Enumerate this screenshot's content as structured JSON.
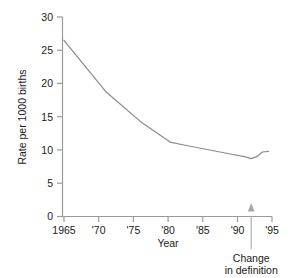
{
  "chart_data": {
    "type": "line",
    "title": "",
    "xlabel": "Year",
    "ylabel": "Rate per 1000 births",
    "xlim": [
      1963.5,
      1995.5
    ],
    "ylim": [
      0,
      30
    ],
    "grid": false,
    "legend": null,
    "line_color": "#8c8c8c",
    "axis_color": "#9a9a9a",
    "x_ticks": [
      1965,
      1970,
      1975,
      1980,
      1985,
      1990,
      1995
    ],
    "x_tick_labels": [
      "1965",
      "'70",
      "'75",
      "'80",
      "'85",
      "'90",
      "'95"
    ],
    "y_ticks": [
      0,
      5,
      10,
      15,
      20,
      25,
      30
    ],
    "y_tick_labels": [
      "0",
      "5",
      "10",
      "15",
      "20",
      "25",
      "30"
    ],
    "series": [
      {
        "name": "Rate per 1000 births",
        "x": [
          1965.0,
          1971.0,
          1976.0,
          1980.3,
          1983.0,
          1986.0,
          1989.0,
          1991.0,
          1992.0,
          1992.8,
          1993.6,
          1994.5
        ],
        "values": [
          26.5,
          18.8,
          14.3,
          11.2,
          10.6,
          10.0,
          9.4,
          9.0,
          8.7,
          9.0,
          9.7,
          9.8
        ]
      }
    ],
    "annotations": [
      {
        "name": "change-in-definition",
        "text_line1": "Change",
        "text_line2": "in definition",
        "x": 1992.0,
        "y": 0,
        "arrow": "up"
      }
    ]
  }
}
